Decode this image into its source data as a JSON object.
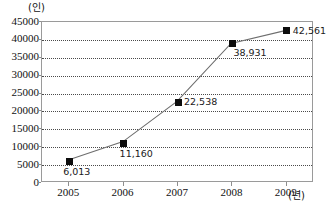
{
  "chart_data": {
    "type": "line",
    "title": "",
    "subtitle": "",
    "xlabel": "(년)",
    "ylabel": "(인)",
    "categories": [
      "2005",
      "2006",
      "2007",
      "2008",
      "2009"
    ],
    "x": [
      2005,
      2006,
      2007,
      2008,
      2009
    ],
    "values": [
      6013,
      11160,
      22538,
      38931,
      42561
    ],
    "point_labels": [
      "6,013",
      "11,160",
      "22,538",
      "38,931",
      "42,561"
    ],
    "series": [
      {
        "name": "",
        "values": [
          6013,
          11160,
          22538,
          38931,
          42561
        ]
      }
    ],
    "ylim": [
      0,
      45000
    ],
    "ytick_step": 5000,
    "ytick_labels": [
      "0",
      "5000",
      "10000",
      "15000",
      "20000",
      "25000",
      "30000",
      "35000",
      "40000",
      "45000"
    ],
    "ytick_values": [
      0,
      5000,
      10000,
      15000,
      20000,
      25000,
      30000,
      35000,
      40000,
      45000
    ],
    "xtick_labels": [
      "2005",
      "2006",
      "2007",
      "2008",
      "2009"
    ],
    "grid": true,
    "grid_orientation": "horizontal",
    "grid_style": "dotted",
    "legend": false,
    "legend_position": "none",
    "marker_style": "square",
    "marker_color": "#0d0d0d",
    "line_color": "#6e6e6e",
    "axis_color": "#9a9a9a",
    "grid_color": "#4a4a4a",
    "background_color": "#ffffff"
  },
  "axis": {
    "y_unit_caption": "(인)",
    "x_unit_caption": "(년)"
  },
  "ticks": {
    "y": [
      {
        "label": "45000",
        "value": 45000
      },
      {
        "label": "40000",
        "value": 40000
      },
      {
        "label": "35000",
        "value": 35000
      },
      {
        "label": "30000",
        "value": 30000
      },
      {
        "label": "25000",
        "value": 25000
      },
      {
        "label": "20000",
        "value": 20000
      },
      {
        "label": "15000",
        "value": 15000
      },
      {
        "label": "10000",
        "value": 10000
      },
      {
        "label": "5000",
        "value": 5000
      },
      {
        "label": "0",
        "value": 0
      }
    ],
    "x": [
      {
        "label": "2005",
        "value": 2005
      },
      {
        "label": "2006",
        "value": 2006
      },
      {
        "label": "2007",
        "value": 2007
      },
      {
        "label": "2008",
        "value": 2008
      },
      {
        "label": "2009",
        "value": 2009
      }
    ]
  },
  "points": [
    {
      "category": "2005",
      "value": 6013,
      "label": "6,013"
    },
    {
      "category": "2006",
      "value": 11160,
      "label": "11,160"
    },
    {
      "category": "2007",
      "value": 22538,
      "label": "22,538"
    },
    {
      "category": "2008",
      "value": 38931,
      "label": "38,931"
    },
    {
      "category": "2009",
      "value": 42561,
      "label": "42,561"
    }
  ]
}
